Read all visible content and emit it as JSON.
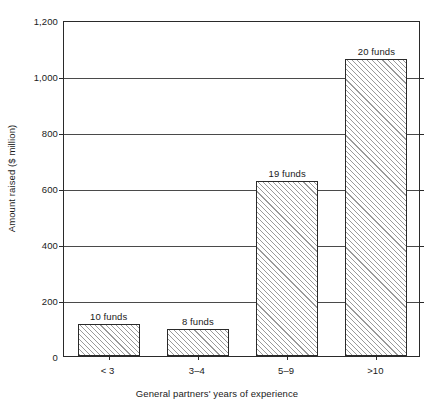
{
  "chart_data": {
    "type": "bar",
    "title": "",
    "xlabel": "General partners' years of experience",
    "ylabel": "Amount raised ($ million)",
    "categories": [
      "< 3",
      "3–4",
      "5–9",
      ">10"
    ],
    "values": [
      115,
      98,
      625,
      1060
    ],
    "point_labels": [
      "10 funds",
      "8 funds",
      "19 funds",
      "20 funds"
    ],
    "ylim": [
      0,
      1200
    ],
    "ytick_labels": [
      "0",
      "200",
      "400",
      "600",
      "800",
      "1,000",
      "1,200"
    ],
    "ytick_values": [
      0,
      200,
      400,
      600,
      800,
      1000,
      1200
    ],
    "grid": true,
    "legend": "none",
    "bar_fill": "hatched-diagonal",
    "bar_edge_color": "#2a2a2a",
    "background_color": "#ffffff"
  }
}
